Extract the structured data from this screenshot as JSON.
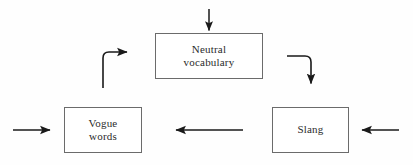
{
  "diagram": {
    "type": "flowchart-cycle",
    "background_color": "#fefefe",
    "box_border_color": "#6b6b6b",
    "arrow_color": "#1a1a1a",
    "text_color": "#2b2b2b",
    "nodes": [
      {
        "id": "neutral",
        "label": "Neutral\nvocabulary",
        "position": "top-center",
        "x": 155,
        "y": 33,
        "width": 108,
        "height": 46
      },
      {
        "id": "vogue",
        "label": "Vogue\nwords",
        "position": "bottom-left",
        "x": 64,
        "y": 107,
        "width": 78,
        "height": 46
      },
      {
        "id": "slang",
        "label": "Slang",
        "position": "bottom-right",
        "x": 272,
        "y": 107,
        "width": 77,
        "height": 46
      }
    ],
    "edges": [
      {
        "id": "input-top",
        "from": "external",
        "to": "neutral",
        "shape": "straight-vertical",
        "direction": "down",
        "label": ""
      },
      {
        "id": "neutral-to-slang",
        "from": "neutral",
        "to": "slang",
        "shape": "elbow-right-down",
        "direction": "down",
        "label": ""
      },
      {
        "id": "slang-to-vogue",
        "from": "slang",
        "to": "vogue",
        "shape": "straight-horizontal",
        "direction": "left",
        "label": ""
      },
      {
        "id": "vogue-to-neutral",
        "from": "vogue",
        "to": "neutral",
        "shape": "elbow-up-right",
        "direction": "right",
        "label": ""
      },
      {
        "id": "input-left",
        "from": "external",
        "to": "vogue",
        "shape": "straight-horizontal",
        "direction": "right",
        "label": ""
      },
      {
        "id": "input-right",
        "from": "external",
        "to": "slang",
        "shape": "straight-horizontal",
        "direction": "left",
        "label": ""
      }
    ]
  }
}
